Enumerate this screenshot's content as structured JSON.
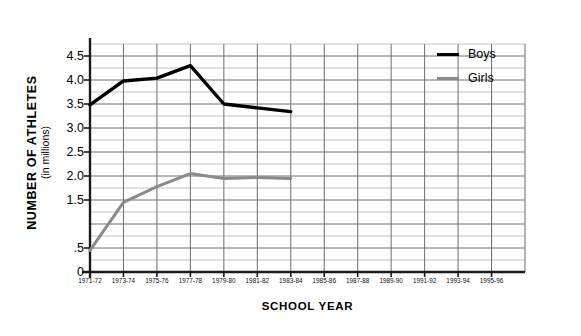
{
  "chart_data": {
    "type": "line",
    "title": "",
    "xlabel": "SCHOOL YEAR",
    "ylabel": "NUMBER OF ATHLETES",
    "ylabel_sub": "(in millions)",
    "categories": [
      "1971-72",
      "1973-74",
      "1975-76",
      "1977-78",
      "1979-80",
      "1981-82",
      "1983-84",
      "1985-86",
      "1987-88",
      "1989-90",
      "1991-92",
      "1993-94",
      "1995-96"
    ],
    "ylim": [
      0,
      4.75
    ],
    "xlim_categories": 13,
    "ytick_labels": [
      "4.5",
      "4.0",
      "3.5",
      "3.0",
      "2.5",
      "2.0",
      "1.5",
      ".5",
      "0"
    ],
    "ytick_values": [
      4.5,
      4.0,
      3.5,
      3.0,
      2.5,
      2.0,
      1.5,
      0.5,
      0
    ],
    "gridlines_major": [
      0,
      0.5,
      1.0,
      1.5,
      2.0,
      2.5,
      3.0,
      3.5,
      4.0,
      4.5
    ],
    "gridlines_minor": [
      0.25,
      0.75,
      1.25,
      1.75,
      2.25,
      2.75,
      3.25,
      3.75,
      4.25,
      4.75
    ],
    "grid": true,
    "legend_position": "upper right",
    "series": [
      {
        "name": "Boys",
        "color": "#000000",
        "x": [
          "1971-72",
          "1973-74",
          "1975-76",
          "1977-78",
          "1979-80",
          "1981-82",
          "1983-84"
        ],
        "values": [
          3.48,
          3.98,
          4.04,
          4.3,
          3.5,
          3.42,
          3.34
        ]
      },
      {
        "name": "Girls",
        "color": "#8a8a8a",
        "x": [
          "1971-72",
          "1973-74",
          "1975-76",
          "1977-78",
          "1979-80",
          "1981-82",
          "1983-84"
        ],
        "values": [
          0.45,
          1.45,
          1.78,
          2.05,
          1.95,
          1.97,
          1.95
        ]
      }
    ]
  },
  "axes": {
    "y_title_main": "NUMBER OF ATHLETES",
    "y_title_sub": "(in millions)",
    "x_title": "SCHOOL YEAR"
  },
  "legend": {
    "items": [
      {
        "label": "Boys",
        "color": "#000000"
      },
      {
        "label": "Girls",
        "color": "#8a8a8a"
      }
    ]
  },
  "colors": {
    "boys": "#000000",
    "girls": "#8a8a8a",
    "grid_major": "#6e6e6e",
    "grid_minor": "#c4c4c4",
    "axis": "#1a1a1a",
    "background": "#ffffff"
  }
}
